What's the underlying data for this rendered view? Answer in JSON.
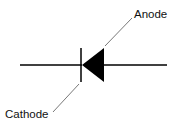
{
  "diagram": {
    "labels": {
      "anode": "Anode",
      "cathode": "Cathode"
    },
    "colors": {
      "stroke": "#000000",
      "leader": "#555555",
      "background": "#ffffff"
    }
  }
}
